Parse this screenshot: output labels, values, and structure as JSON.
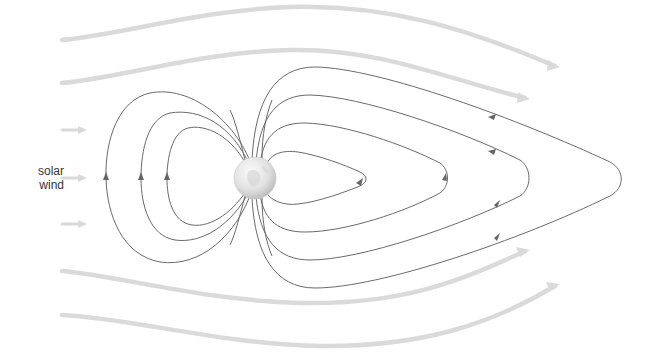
{
  "diagram": {
    "label": {
      "line1": "solar",
      "line2": "wind"
    },
    "elements": {
      "earth": "globe at center-left, magnetic dipole",
      "solar_wind_streamlines": 4,
      "short_wind_arrows": 3,
      "dayside_closed_loops": 3,
      "tail_field_loops": 4
    },
    "colors": {
      "solar_wind": "#dadada",
      "field_lines": "#6a6a6a",
      "label_text": "#333333",
      "earth_light": "#f4f4f4",
      "earth_dark": "#b8b8b8",
      "background": "#ffffff"
    }
  }
}
